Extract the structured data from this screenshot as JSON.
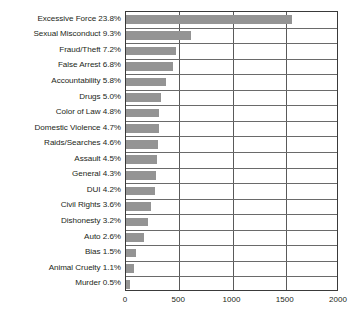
{
  "chart_data": {
    "type": "bar",
    "orientation": "horizontal",
    "title": "",
    "subtitle": "",
    "xlabel": "",
    "ylabel": "",
    "xlim": [
      0,
      2000
    ],
    "grid": true,
    "legend": null,
    "bar_color": "#949494",
    "axis_color": "#3a3a3a",
    "text_color": "#231f20",
    "xticks": [
      "0",
      "500",
      "1000",
      "1500",
      "2000"
    ],
    "xtick_values": [
      0,
      500,
      1000,
      1500,
      2000
    ],
    "categories": [
      "Excessive Force 23.8%",
      "Sexual Misconduct 9.3%",
      "Fraud/Theft 7.2%",
      "False Arrest 6.8%",
      "Accountability 5.8%",
      "Drugs 5.0%",
      "Color of Law 4.8%",
      "Domestic Violence 4.7%",
      "Raids/Searches 4.6%",
      "Assault 4.5%",
      "General 4.3%",
      "DUI 4.2%",
      "Civil Rights 3.6%",
      "Dishonesty 3.2%",
      "Auto 2.6%",
      "Bias 1.5%",
      "Animal Cruelty 1.1%",
      "Murder 0.5%"
    ],
    "category_names": [
      "Excessive Force",
      "Sexual Misconduct",
      "Fraud/Theft",
      "False Arrest",
      "Accountability",
      "Drugs",
      "Color of Law",
      "Domestic Violence",
      "Raids/Searches",
      "Assault",
      "General",
      "DUI",
      "Civil Rights",
      "Dishonesty",
      "Auto",
      "Bias",
      "Animal Cruelty",
      "Murder"
    ],
    "percents": [
      23.8,
      9.3,
      7.2,
      6.8,
      5.8,
      5.0,
      4.8,
      4.7,
      4.6,
      4.5,
      4.3,
      4.2,
      3.6,
      3.2,
      2.6,
      1.5,
      1.1,
      0.5
    ],
    "values": [
      1557,
      608,
      471,
      445,
      379,
      327,
      314,
      307,
      301,
      294,
      281,
      275,
      235,
      209,
      170,
      98,
      72,
      33
    ]
  }
}
